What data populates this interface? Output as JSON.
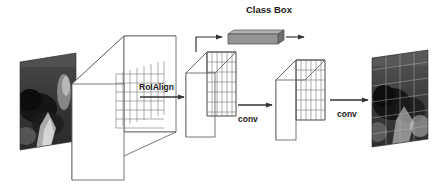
{
  "figure": {
    "background_color": "#ffffff",
    "stroke_color": "#333333",
    "label_color": "#1a1a1a",
    "head_bar_color": "#8c8c8c"
  },
  "labels": {
    "class_box": "Class Box",
    "roi_align": "RoIAlign",
    "conv_1": "conv",
    "conv_2": "conv"
  },
  "nodes": [
    {
      "id": "input-image",
      "name": "input-image",
      "kind": "photo",
      "description": "dark grayscale input photograph"
    },
    {
      "id": "backbone-feature-map",
      "name": "backbone-feature-map",
      "kind": "feature-volume",
      "grid_cols": 7,
      "grid_rows": 6
    },
    {
      "id": "roi-feature-volume",
      "name": "roi-feature-volume",
      "kind": "feature-volume",
      "grid_cols": 6,
      "grid_rows": 7
    },
    {
      "id": "class-box-head",
      "name": "class-box-head",
      "kind": "fc-head-bar"
    },
    {
      "id": "mask-feature-volume",
      "name": "mask-feature-volume",
      "kind": "feature-volume",
      "grid_cols": 6,
      "grid_rows": 6
    },
    {
      "id": "output-image",
      "name": "output-image",
      "kind": "photo",
      "description": "segmented / masked output photograph"
    }
  ],
  "edges": [
    {
      "from": "input-image",
      "to": "backbone-feature-map",
      "label": ""
    },
    {
      "from": "backbone-feature-map",
      "to": "roi-feature-volume",
      "label": "RoIAlign"
    },
    {
      "from": "roi-feature-volume",
      "to": "class-box-head",
      "label": "Class Box"
    },
    {
      "from": "class-box-head",
      "to": "output-prediction",
      "label": ""
    },
    {
      "from": "roi-feature-volume",
      "to": "mask-feature-volume",
      "label": "conv"
    },
    {
      "from": "mask-feature-volume",
      "to": "output-image",
      "label": "conv"
    }
  ]
}
